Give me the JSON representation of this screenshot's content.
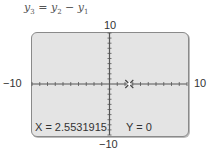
{
  "chart_data": {
    "type": "line",
    "title": "y3 = y2 − y1",
    "title_parts": {
      "lhs": "y",
      "lhs_sub": "3",
      "eq": " = ",
      "a": "y",
      "a_sub": "2",
      "op": " − ",
      "b": "y",
      "b_sub": "1"
    },
    "xlim": [
      -10,
      10
    ],
    "ylim": [
      -10,
      10
    ],
    "x_tick_labels": {
      "min": "−10",
      "max": "10"
    },
    "y_tick_labels": {
      "min": "−10",
      "max": "10"
    },
    "xscl": 1,
    "yscl": 1,
    "grid": false,
    "cursor": {
      "x": 2.5531915,
      "y": 0
    },
    "readout": {
      "x_text": "X = 2.5531915",
      "y_text": "Y = 0"
    },
    "colors": {
      "screen_bg": "#e4e4e4",
      "border": "#8a8a8a",
      "axis": "#555555"
    }
  }
}
